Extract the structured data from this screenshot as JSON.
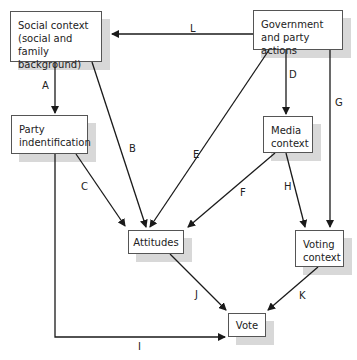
{
  "diagram": {
    "nodes": {
      "social_context": {
        "label": "Social context (social and family background)"
      },
      "government": {
        "label": "Government and party actions"
      },
      "party_id": {
        "label": "Party indentification"
      },
      "media": {
        "label": "Media context"
      },
      "attitudes": {
        "label": "Attitudes"
      },
      "voting_context": {
        "label": "Voting context"
      },
      "vote": {
        "label": "Vote"
      }
    },
    "edges": [
      {
        "id": "A",
        "from": "social_context",
        "to": "party_id",
        "label": "A"
      },
      {
        "id": "B",
        "from": "social_context",
        "to": "attitudes",
        "label": "B"
      },
      {
        "id": "C",
        "from": "party_id",
        "to": "attitudes",
        "label": "C"
      },
      {
        "id": "D",
        "from": "government",
        "to": "media",
        "label": "D"
      },
      {
        "id": "E",
        "from": "government",
        "to": "attitudes",
        "label": "E"
      },
      {
        "id": "F",
        "from": "media",
        "to": "attitudes",
        "label": "F"
      },
      {
        "id": "G",
        "from": "government",
        "to": "voting_context",
        "label": "G"
      },
      {
        "id": "H",
        "from": "media",
        "to": "voting_context",
        "label": "H"
      },
      {
        "id": "I",
        "from": "party_id",
        "to": "vote",
        "label": "I"
      },
      {
        "id": "J",
        "from": "attitudes",
        "to": "vote",
        "label": "J"
      },
      {
        "id": "K",
        "from": "voting_context",
        "to": "vote",
        "label": "K"
      },
      {
        "id": "L",
        "from": "government",
        "to": "social_context",
        "label": "L"
      }
    ],
    "colors": {
      "line": "#1a1a1a",
      "box_border": "#555555",
      "shadow": "#d8d8d8"
    }
  }
}
